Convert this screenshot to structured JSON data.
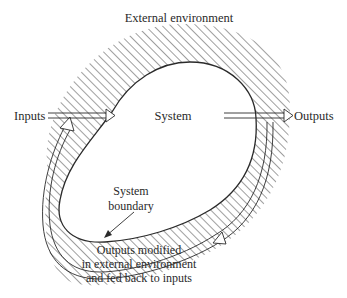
{
  "diagram": {
    "title_label": "External environment",
    "system_label": "System",
    "inputs_label": "Inputs",
    "outputs_label": "Outputs",
    "boundary_label": {
      "line1": "System",
      "line2": "boundary"
    },
    "feedback_label": {
      "line1": "Outputs modified",
      "line2": "in external environment",
      "line3": "and fed back to inputs"
    },
    "colors": {
      "ink": "#2a2a2a",
      "background": "#ffffff"
    }
  }
}
